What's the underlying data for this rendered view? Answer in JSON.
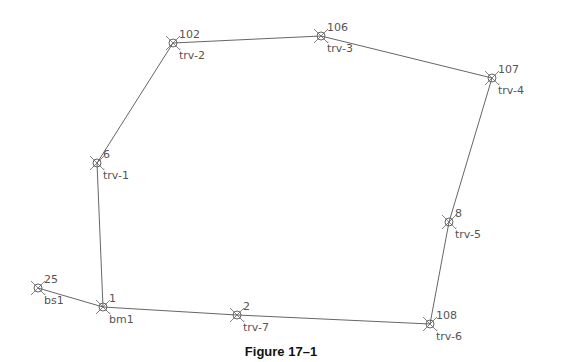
{
  "figure": {
    "caption": "Figure 17–1",
    "line_color": "#666666",
    "label_color": "#555555"
  },
  "points": [
    {
      "number": "25",
      "desc": "bs1",
      "x": 38,
      "y": 288
    },
    {
      "number": "1",
      "desc": "bm1",
      "x": 103,
      "y": 307
    },
    {
      "number": "2",
      "desc": "trv-7",
      "x": 237,
      "y": 315
    },
    {
      "number": "108",
      "desc": "trv-6",
      "x": 430,
      "y": 324
    },
    {
      "number": "8",
      "desc": "trv-5",
      "x": 449,
      "y": 222
    },
    {
      "number": "107",
      "desc": "trv-4",
      "x": 492,
      "y": 78
    },
    {
      "number": "106",
      "desc": "trv-3",
      "x": 321,
      "y": 36
    },
    {
      "number": "102",
      "desc": "trv-2",
      "x": 173,
      "y": 43
    },
    {
      "number": "6",
      "desc": "trv-1",
      "x": 97,
      "y": 163
    }
  ],
  "traverse_order": [
    "25",
    "1",
    "2",
    "108",
    "8",
    "107",
    "106",
    "102",
    "6",
    "1"
  ]
}
